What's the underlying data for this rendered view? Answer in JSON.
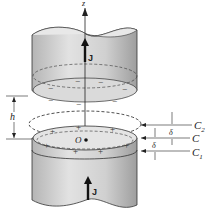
{
  "diagram": {
    "labels": {
      "z_axis": "z",
      "current_upper": "J",
      "current_lower": "J",
      "gap": "h",
      "origin": "O",
      "contour_upper": "C",
      "contour_upper_sub": "2",
      "contour_middle": "C",
      "contour_lower": "C",
      "contour_lower_sub": "1",
      "spacing_upper": "δ",
      "spacing_lower": "δ"
    },
    "charges": {
      "upper_face": "−",
      "lower_face": "+"
    },
    "colors": {
      "cylinder_fill": "#d6d6d6",
      "cylinder_dark": "#a8a8a8",
      "line": "#222222"
    }
  }
}
